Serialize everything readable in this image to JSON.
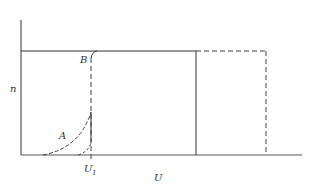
{
  "diagram": {
    "y_axis_label": "n",
    "x_axis_label": "U",
    "curve_labels": {
      "a": "A",
      "b": "B"
    },
    "marker": {
      "main": "U",
      "subscript": "1"
    },
    "line_color": "#333333"
  }
}
